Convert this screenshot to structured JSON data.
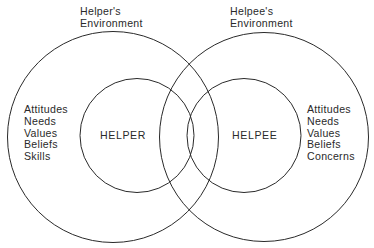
{
  "diagram": {
    "type": "overlapping-venn",
    "stroke_color": "#2a2a2a",
    "helper": {
      "environment_label_line1": "Helper's",
      "environment_label_line2": "Environment",
      "center_label": "HELPER",
      "attributes": [
        "Attitudes",
        "Needs",
        "Values",
        "Beliefs",
        "Skills"
      ]
    },
    "helpee": {
      "environment_label_line1": "Helpee's",
      "environment_label_line2": "Environment",
      "center_label": "HELPEE",
      "attributes": [
        "Attitudes",
        "Needs",
        "Values",
        "Beliefs",
        "Concerns"
      ]
    }
  }
}
